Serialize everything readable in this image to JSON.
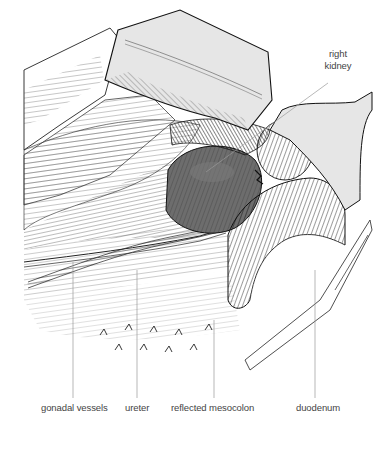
{
  "figure": {
    "labels": {
      "right_kidney_line1": "right",
      "right_kidney_line2": "kidney",
      "gonadal_vessels": "gonadal vessels",
      "ureter": "ureter",
      "reflected_mesocolon": "reflected mesocolon",
      "duodenum": "duodenum"
    },
    "colors": {
      "ink": "#1a1a1a",
      "leader_line": "#9a9a9a",
      "retractor_fill": "#e6e6e6",
      "kidney_fill": "#6d6d6d",
      "label_text": "#444444"
    }
  }
}
